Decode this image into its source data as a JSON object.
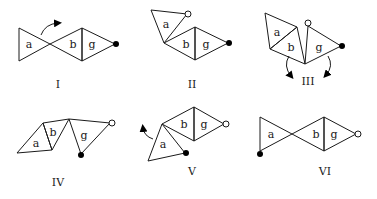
{
  "diagram": {
    "triangle_labels": {
      "a": "a",
      "b": "b",
      "g": "g"
    },
    "panels": [
      {
        "id": "I",
        "label": "I",
        "description": "a, b, g triangles in a row (bow-tie); arrow rotating a upward; filled dot at tip of g"
      },
      {
        "id": "II",
        "label": "II",
        "description": "a rotated up with open dot at tip; b and g in row; filled dot at tip of g"
      },
      {
        "id": "III",
        "label": "III",
        "description": "a and b folded together; g with open dot and filled dot; two downward arrows"
      },
      {
        "id": "IV",
        "label": "IV",
        "description": "a, b, g in zigzag chain; open dot top-right, filled dot below g"
      },
      {
        "id": "V",
        "label": "V",
        "description": "b and g diamond; a hanging below-left with filled dot; arrow rotating a; open dot at tip of g"
      },
      {
        "id": "VI",
        "label": "VI",
        "description": "a, b, g in row (bow-tie); filled dot below a; open dot at tip of g"
      }
    ],
    "markers": {
      "filled_dot": "filled-dot",
      "open_dot": "open-dot",
      "arrow": "rotation-arrow"
    },
    "colors": {
      "stroke": "#1a1a1a",
      "background": "#ffffff"
    }
  }
}
